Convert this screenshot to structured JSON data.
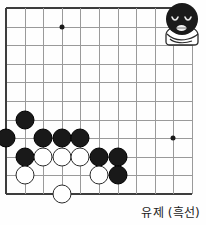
{
  "caption": {
    "text": "유제 (흑선)"
  },
  "board": {
    "name": "go-board",
    "columns": 11,
    "rows": 11,
    "left": 6,
    "top": 8,
    "spacing": 18.6,
    "line_color": "#9a9a9a",
    "edge_color": "#3d3d3d",
    "star_points": [
      {
        "col": 3,
        "row": 1
      },
      {
        "col": 9,
        "row": 7
      }
    ],
    "stones": [
      {
        "color": "black",
        "col": 1,
        "row": 6
      },
      {
        "color": "black",
        "col": 0,
        "row": 7
      },
      {
        "color": "black",
        "col": 2,
        "row": 7
      },
      {
        "color": "black",
        "col": 3,
        "row": 7
      },
      {
        "color": "black",
        "col": 4,
        "row": 7
      },
      {
        "color": "black",
        "col": 1,
        "row": 8
      },
      {
        "color": "white",
        "col": 2,
        "row": 8
      },
      {
        "color": "white",
        "col": 3,
        "row": 8
      },
      {
        "color": "white",
        "col": 4,
        "row": 8
      },
      {
        "color": "black",
        "col": 5,
        "row": 8
      },
      {
        "color": "black",
        "col": 6,
        "row": 8
      },
      {
        "color": "white",
        "col": 1,
        "row": 9
      },
      {
        "color": "white",
        "col": 5,
        "row": 9
      },
      {
        "color": "black",
        "col": 6,
        "row": 9
      },
      {
        "color": "white",
        "col": 3,
        "row": 10
      }
    ]
  },
  "mascot": {
    "name": "black-stone-character",
    "head_color": "#1a1a1a",
    "body_color": "#ffffff",
    "outline_color": "#2a2a2a",
    "expression": "closed-eyes-smile"
  }
}
